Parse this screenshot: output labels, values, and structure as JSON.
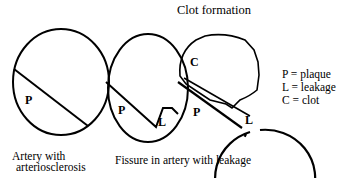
{
  "title": "Clot formation",
  "panels": [
    {
      "caption_line1": "Artery with",
      "caption_line2": "arteriosclerosis",
      "labels": [
        "P"
      ]
    },
    {
      "caption": "Fissure in artery with leakage",
      "labels": [
        "P",
        "L"
      ]
    },
    {
      "labels": [
        "C",
        "P",
        "L"
      ]
    }
  ],
  "legend": [
    {
      "text": "P = plaque"
    },
    {
      "text": "L = leakage"
    },
    {
      "text": "C = clot"
    }
  ],
  "colors": {
    "stroke": "#000000",
    "background": "#ffffff"
  }
}
